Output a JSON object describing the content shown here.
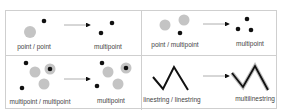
{
  "panels": [
    {
      "id": "point-point",
      "input_label": "point / point",
      "output_label": "multipoint"
    },
    {
      "id": "point-multipoint",
      "input_label": "point / multipoint",
      "output_label": "multipoint"
    },
    {
      "id": "multipoint-multipoint",
      "input_label": "multipoint / multipoint",
      "output_label": "multipoint"
    },
    {
      "id": "linestring-linestring",
      "input_label": "linestring  / linestring",
      "output_label": "multilinestring"
    }
  ],
  "colors": {
    "border": "#cfcfcf",
    "gray_point": "#c4c4c4",
    "black_point": "#111111",
    "arrow": "#9a9a9a",
    "line_shadow": "#bdbdbd"
  }
}
